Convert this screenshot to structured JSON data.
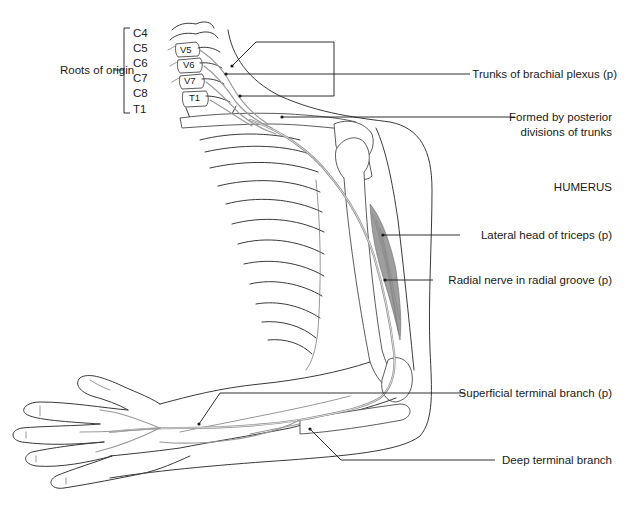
{
  "figure": {
    "roots_label": "Roots of origin",
    "roots": [
      "C4",
      "C5",
      "C6",
      "C7",
      "C8",
      "T1"
    ],
    "vertebrae": [
      "V5",
      "V6",
      "V7",
      "T1"
    ],
    "labels": {
      "trunks": "Trunks of brachial plexus (p)",
      "posterior_line1": "Formed by posterior",
      "posterior_line2": "divisions of trunks",
      "humerus": "HUMERUS",
      "lateral_head": "Lateral head of triceps (p)",
      "radial_groove": "Radial nerve in radial groove (p)",
      "superficial": "Superficial terminal branch (p)",
      "deep": "Deep terminal branch"
    }
  }
}
